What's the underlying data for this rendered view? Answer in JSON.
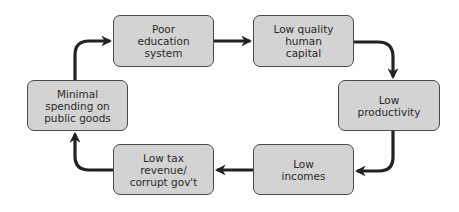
{
  "diagram": {
    "type": "cycle",
    "colors": {
      "node_fill": "#d3d3d3",
      "node_border": "#4a4a4a",
      "arrow": "#222222",
      "text": "#2a2a2a"
    },
    "nodes": [
      {
        "id": "poor-education",
        "label": "Poor\neducation\nsystem"
      },
      {
        "id": "low-human-capital",
        "label": "Low quality\nhuman\ncapital"
      },
      {
        "id": "low-productivity",
        "label": "Low\nproductivity"
      },
      {
        "id": "low-incomes",
        "label": "Low\nincomes"
      },
      {
        "id": "low-tax-revenue",
        "label": "Low tax\nrevenue/\ncorrupt gov't"
      },
      {
        "id": "minimal-spending",
        "label": "Minimal\nspending on\npublic goods"
      }
    ],
    "edges": [
      {
        "from": "poor-education",
        "to": "low-human-capital"
      },
      {
        "from": "low-human-capital",
        "to": "low-productivity"
      },
      {
        "from": "low-productivity",
        "to": "low-incomes"
      },
      {
        "from": "low-incomes",
        "to": "low-tax-revenue"
      },
      {
        "from": "low-tax-revenue",
        "to": "minimal-spending"
      },
      {
        "from": "minimal-spending",
        "to": "poor-education"
      }
    ]
  }
}
